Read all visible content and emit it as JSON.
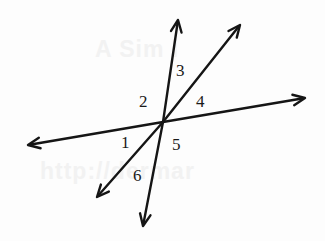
{
  "figure": {
    "background_color": "#fdfdfd",
    "line_color": "#151515",
    "vertex": {
      "x": 163,
      "y": 122
    },
    "rays": [
      {
        "name": "ray-up",
        "tip_x": 178,
        "tip_y": 20,
        "arrowhead": true
      },
      {
        "name": "ray-up-right",
        "tip_x": 240,
        "tip_y": 25,
        "arrowhead": true
      },
      {
        "name": "ray-right",
        "tip_x": 305,
        "tip_y": 98,
        "arrowhead": true
      },
      {
        "name": "ray-left",
        "tip_x": 28,
        "tip_y": 145,
        "arrowhead": true
      },
      {
        "name": "ray-down-left",
        "tip_x": 97,
        "tip_y": 197,
        "arrowhead": true
      },
      {
        "name": "ray-down",
        "tip_x": 143,
        "tip_y": 226,
        "arrowhead": true
      }
    ],
    "angle_labels": [
      {
        "text": "1",
        "x": 121,
        "y": 134
      },
      {
        "text": "2",
        "x": 139,
        "y": 93
      },
      {
        "text": "3",
        "x": 176,
        "y": 62
      },
      {
        "text": "4",
        "x": 196,
        "y": 93
      },
      {
        "text": "5",
        "x": 172,
        "y": 136
      },
      {
        "text": "6",
        "x": 133,
        "y": 167
      }
    ],
    "watermark_top": "A      Sim l",
    "watermark_bottom": "http://dermar"
  }
}
